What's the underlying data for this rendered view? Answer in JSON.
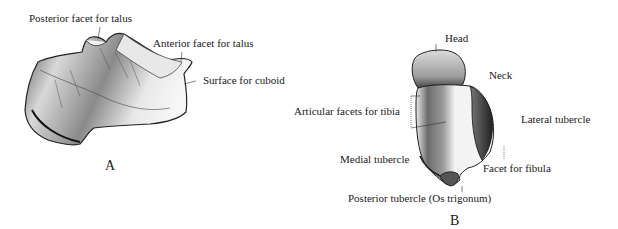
{
  "figure_a": {
    "caption": "A",
    "labels": {
      "posterior_facet": "Posterior facet for talus",
      "anterior_facet": "Anterior facet for talus",
      "surface_cuboid": "Surface for cuboid"
    }
  },
  "figure_b": {
    "caption": "B",
    "labels": {
      "head": "Head",
      "neck": "Neck",
      "articular_facets": "Articular facets for tibia",
      "lateral_tubercle": "Lateral tubercle",
      "medial_tubercle": "Medial tubercle",
      "facet_fibula": "Facet for fibula",
      "posterior_tubercle": "Posterior tubercle (Os trigonum)"
    }
  }
}
